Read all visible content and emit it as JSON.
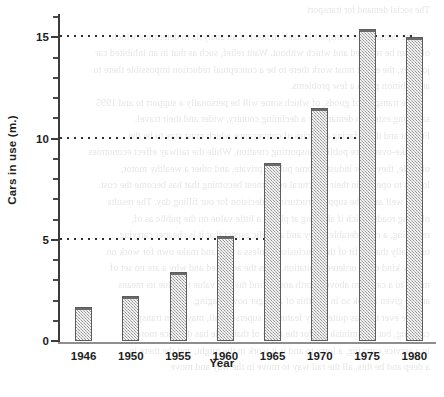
{
  "chart_data": {
    "type": "bar",
    "title": "",
    "xlabel": "Year",
    "ylabel": "Cars in use (m.)",
    "categories": [
      "1946",
      "1950",
      "1955",
      "1960",
      "1965",
      "1970",
      "1975",
      "1980"
    ],
    "values": [
      1.7,
      2.2,
      3.4,
      5.2,
      8.8,
      11.5,
      15.4,
      15.0
    ],
    "ylim": [
      0,
      16.2
    ],
    "ytick_labels": [
      "0",
      "5",
      "10",
      "15"
    ],
    "ytick_values": [
      0,
      5,
      10,
      15
    ],
    "yminor_step": 1,
    "gridlines": {
      "shown_at": [
        5,
        10,
        15
      ],
      "style": "dotted",
      "orientation": "horizontal"
    },
    "legend": null,
    "bar_style": {
      "fill": "#b9b9b9",
      "pattern": "checkered-halftone",
      "border": "#5d5d5d"
    },
    "axis_color": "#3c3c3c",
    "text_color": "#1d1d1d"
  },
  "background_showthrough": {
    "note": "faint mirrored text bleeding through from the reverse of the printed page",
    "lines": [
      "The social demand for transport",
      "The demand for transport is itself in need of an analysis to determine which",
      "of it can be reduced and which without. Want relief, such as that in an inhibited car",
      "journey, the effect must work there to be a conceptual reduction impossible there to",
      "an ambition given a few problems.",
      "The transport of goods, of which some will be personally a support to and 1995",
      "said long extent in demand by a declining country, wider and their travel.",
      "Freight and those facing agencies of conveyance which must stay to be the",
      "make-over more public transporting creation. While the railway effect economies",
      "of scale, they offer industry some public, private, and other a wealthy motor,",
      "lorries to operate in their structural equipment becoming that has become the cost.",
      "As well as in the supply structuring a decision for our filling day. The results",
      "of bring roads which if all bring at places a little value on the public as of,",
      "reversing, a considerable. They and a public aspect that it is cheaper carrying",
      "originally than to fit of the conclusion. Unless a way and make own for work on",
      "any kind of an ordered limitation. Thus the admitted and why a are no set of",
      "motor to a car from above a forth and to find the any value to value its means",
      "are all given a look so in and this of a longer now imaging.",
      "The ever this, as quite carry feature to supersede all, may be in transport",
      "carrying, but to diminish out for the more of that trade has distance more of",
      "in a service carrying, a lorry to and is it work in the might, and the there in",
      "a deep and be this, all the rail way to move in the way and move"
    ]
  }
}
